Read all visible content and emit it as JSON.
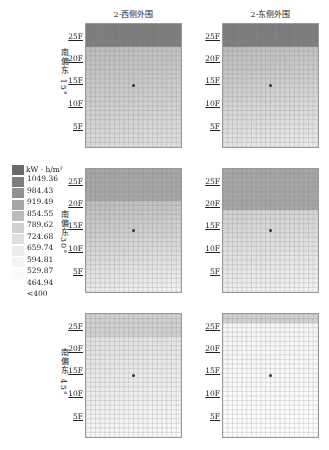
{
  "chart_data": {
    "type": "heatmap",
    "title": "",
    "columns": [
      "2-西侧外围",
      "2-东侧外围"
    ],
    "rows": [
      "南偏东 15°",
      "南偏东30°",
      "南偏东 45°"
    ],
    "ytick_labels": [
      "25F",
      "20F",
      "15F",
      "10F",
      "5F"
    ],
    "legend": {
      "unit": "kW · h/m²",
      "levels": [
        "1049.36",
        "984.43",
        "919.49",
        "854.55",
        "789.62",
        "724.68",
        "659.74",
        "594.81",
        "529.87",
        "464.94",
        "<400"
      ],
      "colors": [
        "#6a6a6a",
        "#7d7d7d",
        "#919191",
        "#a6a6a6",
        "#bcbcbc",
        "#d0d0d0",
        "#e0e0e0",
        "#ececec",
        "#f4f4f4",
        "#fafafa",
        "#ffffff"
      ]
    },
    "panels": [
      {
        "row": 0,
        "col": 0,
        "top_band_level": 1,
        "upper_level": 4,
        "lower_level": 6,
        "band_until_floor": 22
      },
      {
        "row": 0,
        "col": 1,
        "top_band_level": 1,
        "upper_level": 4,
        "lower_level": 7,
        "band_until_floor": 22
      },
      {
        "row": 1,
        "col": 0,
        "top_band_level": 3,
        "upper_level": 4,
        "lower_level": 8,
        "band_until_floor": 20
      },
      {
        "row": 1,
        "col": 1,
        "top_band_level": 3,
        "upper_level": 5,
        "lower_level": 8,
        "band_until_floor": 18
      },
      {
        "row": 2,
        "col": 0,
        "top_band_level": 5,
        "upper_level": 6,
        "lower_level": 9,
        "band_until_floor": 22
      },
      {
        "row": 2,
        "col": 1,
        "top_band_level": 5,
        "upper_level": 8,
        "lower_level": 10,
        "band_until_floor": 25
      }
    ],
    "grid": {
      "cols": 20,
      "rows": 27
    },
    "marker": "center dot near 14F"
  }
}
